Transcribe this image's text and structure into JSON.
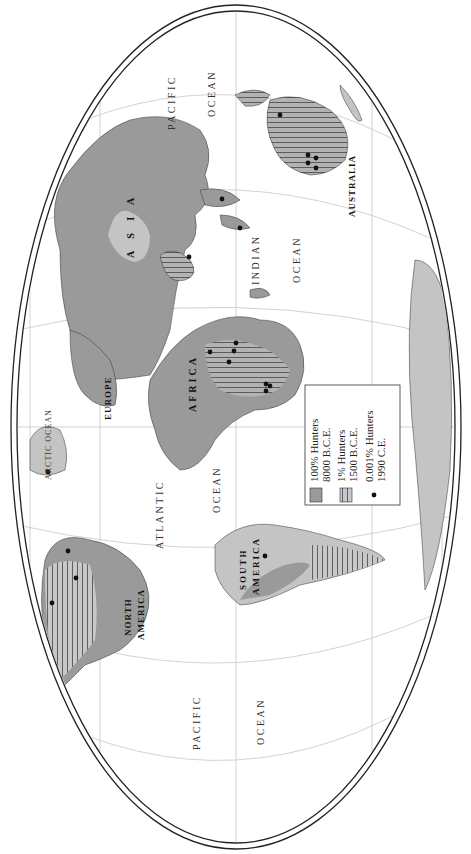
{
  "map": {
    "orientation": "rotated 90 degrees clockwise",
    "colors": {
      "full_hunters": "#9a9a9a",
      "partial_land": "#c4c4c4",
      "hatch": "#555555",
      "ocean": "#ffffff",
      "graticule": "#bdbdbd",
      "border": "#222222"
    },
    "oceans": {
      "pacific_east": [
        "PACIFIC",
        "OCEAN"
      ],
      "pacific_west": [
        "PACIFIC",
        "OCEAN"
      ],
      "atlantic": [
        "ATLANTIC",
        "OCEAN"
      ],
      "indian": [
        "INDIAN",
        "OCEAN"
      ],
      "arctic": "ARCTIC OCEAN"
    },
    "continents": {
      "north_america": [
        "NORTH",
        "AMERICA"
      ],
      "south_america": [
        "SOUTH",
        "AMERICA"
      ],
      "europe": "EUROPE",
      "africa": "AFRICA",
      "asia": "A S I A",
      "australia": "AUSTRALIA"
    }
  },
  "legend": {
    "items": [
      {
        "symbol": "solid-gray-swatch",
        "line1": "100% Hunters",
        "line2": "8000 B.C.E."
      },
      {
        "symbol": "hatched-swatch",
        "line1": "1% Hunters",
        "line2": "1500 B.C.E."
      },
      {
        "symbol": "black-dot",
        "line1": "0.001% Hunters",
        "line2": "1990 C.E."
      }
    ]
  }
}
